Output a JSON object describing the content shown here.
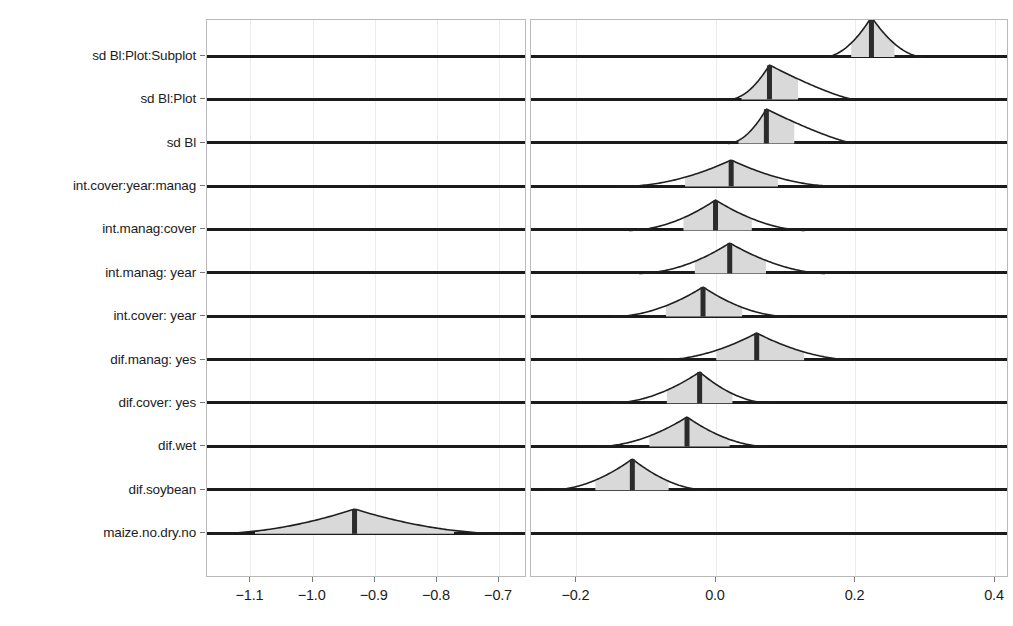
{
  "chart_data": {
    "type": "area",
    "title": "",
    "xlabel": "",
    "ylabel": "",
    "grid": true,
    "legend_position": "none",
    "broken_axis": true,
    "panels": [
      {
        "name": "left-panel",
        "xlim": [
          -1.17,
          -0.655
        ],
        "ticks": [
          -1.1,
          -1.0,
          -0.9,
          -0.8,
          -0.7
        ],
        "ticklabels": [
          "−1.1",
          "−1.0",
          "−0.9",
          "−0.8",
          "−0.7"
        ]
      },
      {
        "name": "right-panel",
        "xlim": [
          -0.265,
          0.42
        ],
        "ticks": [
          -0.2,
          0.0,
          0.2,
          0.4
        ],
        "ticklabels": [
          "−0.2",
          "0.0",
          "0.2",
          "0.4"
        ]
      }
    ],
    "categories": [
      "sd Bl:Plot:Subplot",
      "sd Bl:Plot",
      "sd Bl",
      "int.cover:year:manag",
      "int.manag:cover",
      "int.manag: year",
      "int.cover: year",
      "dif.manag: yes",
      "dif.cover: yes",
      "dif.wet",
      "dif.soybean",
      "maize.no.dry.no"
    ],
    "series": [
      {
        "name": "posterior-density",
        "rows": [
          {
            "label": "sd Bl:Plot:Subplot",
            "panel": "right-panel",
            "median": 0.223,
            "inner_lo": 0.194,
            "inner_hi": 0.256,
            "outer_lo": 0.155,
            "outer_hi": 0.298,
            "peak": 1.0,
            "skew": 0.0
          },
          {
            "label": "sd Bl:Plot",
            "panel": "right-panel",
            "median": 0.077,
            "inner_lo": 0.037,
            "inner_hi": 0.118,
            "outer_lo": 0.019,
            "outer_hi": 0.197,
            "peak": 0.86,
            "skew": 0.62
          },
          {
            "label": "sd Bl",
            "panel": "right-panel",
            "median": 0.072,
            "inner_lo": 0.032,
            "inner_hi": 0.112,
            "outer_lo": 0.017,
            "outer_hi": 0.197,
            "peak": 0.86,
            "skew": 0.62
          },
          {
            "label": "int.cover:year:manag",
            "panel": "right-panel",
            "median": 0.022,
            "inner_lo": -0.044,
            "inner_hi": 0.089,
            "outer_lo": -0.133,
            "outer_hi": 0.175,
            "peak": 0.66,
            "skew": 0.0
          },
          {
            "label": "int.manag:cover",
            "panel": "right-panel",
            "median": 0.0,
            "inner_lo": -0.046,
            "inner_hi": 0.052,
            "outer_lo": -0.124,
            "outer_hi": 0.128,
            "peak": 0.76,
            "skew": 0.08
          },
          {
            "label": "int.manag: year",
            "panel": "right-panel",
            "median": 0.02,
            "inner_lo": -0.03,
            "inner_hi": 0.072,
            "outer_lo": -0.11,
            "outer_hi": 0.157,
            "peak": 0.76,
            "skew": 0.1
          },
          {
            "label": "int.cover: year",
            "panel": "right-panel",
            "median": -0.019,
            "inner_lo": -0.072,
            "inner_hi": 0.037,
            "outer_lo": -0.148,
            "outer_hi": 0.103,
            "peak": 0.74,
            "skew": 0.0
          },
          {
            "label": "dif.manag: yes",
            "panel": "right-panel",
            "median": 0.058,
            "inner_lo": 0.0,
            "inner_hi": 0.126,
            "outer_lo": -0.082,
            "outer_hi": 0.203,
            "peak": 0.68,
            "skew": 0.0
          },
          {
            "label": "dif.cover: yes",
            "panel": "right-panel",
            "median": -0.023,
            "inner_lo": -0.07,
            "inner_hi": 0.024,
            "outer_lo": -0.15,
            "outer_hi": 0.078,
            "peak": 0.78,
            "skew": 0.0
          },
          {
            "label": "dif.wet",
            "panel": "right-panel",
            "median": -0.041,
            "inner_lo": -0.095,
            "inner_hi": 0.02,
            "outer_lo": -0.17,
            "outer_hi": 0.075,
            "peak": 0.74,
            "skew": 0.0
          },
          {
            "label": "dif.soybean",
            "panel": "right-panel",
            "median": -0.12,
            "inner_lo": -0.173,
            "inner_hi": -0.068,
            "outer_lo": -0.238,
            "outer_hi": -0.012,
            "peak": 0.78,
            "skew": 0.0
          },
          {
            "label": "maize.no.dry.no",
            "panel": "left-panel",
            "median": -0.932,
            "inner_lo": -1.092,
            "inner_hi": -0.772,
            "outer_lo": -1.163,
            "outer_hi": -0.687,
            "peak": 0.62,
            "skew": 0.0
          }
        ]
      }
    ],
    "colors": {
      "density_fill": "#d9d9d9",
      "density_outline": "#1f1f1f",
      "median_bar": "#2b2b2b",
      "row_baseline": "#1b1b1b",
      "gridline": "#ececec",
      "panel_border": "#b9b9b9",
      "text": "#1c1c1c",
      "background": "#ffffff"
    }
  },
  "axis": {
    "y_labels": [
      "sd Bl:Plot:Subplot",
      "sd Bl:Plot",
      "sd Bl",
      "int.cover:year:manag",
      "int.manag:cover",
      "int.manag: year",
      "int.cover: year",
      "dif.manag: yes",
      "dif.cover: yes",
      "dif.wet",
      "dif.soybean",
      "maize.no.dry.no"
    ],
    "x_labels_left": [
      "−1.1",
      "−1.0",
      "−0.9",
      "−0.8",
      "−0.7"
    ],
    "x_labels_right": [
      "−0.2",
      "0.0",
      "0.2",
      "0.4"
    ]
  }
}
